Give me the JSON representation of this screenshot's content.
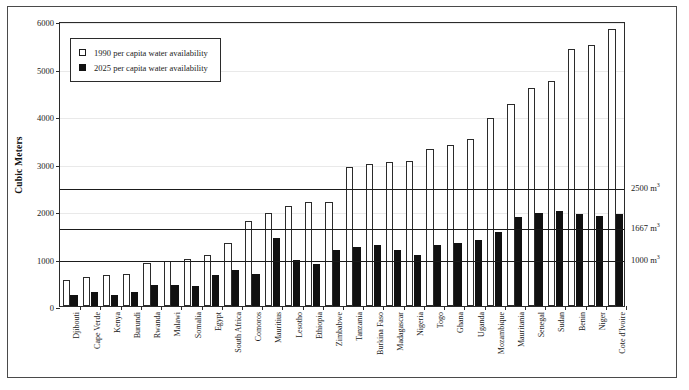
{
  "chart_data": {
    "type": "bar",
    "title": "",
    "xlabel": "",
    "ylabel": "Cubic Meters",
    "ylim": [
      0,
      6000
    ],
    "ytick_values": [
      0,
      1000,
      2000,
      3000,
      4000,
      5000,
      6000
    ],
    "ytick_labels": [
      "0",
      "1000",
      "2000",
      "3000",
      "4000",
      "5000",
      "6000"
    ],
    "grid": true,
    "legend_position": "upper-left-inside",
    "legend": [
      {
        "label": "1990 per capita water availability",
        "swatch": "open-square"
      },
      {
        "label": "2025 per capita water availability",
        "swatch": "filled-square"
      }
    ],
    "categories": [
      "Djibouti",
      "Cape Verde",
      "Kenya",
      "Burundi",
      "Rwanda",
      "Malawi",
      "Somalia",
      "Egypt",
      "South Africa",
      "Comoros",
      "Mauritius",
      "Lesotho",
      "Ethiopia",
      "Zimbabwe",
      "Tanzania",
      "Burkina Faso",
      "Madagascar",
      "Nigeria",
      "Togo",
      "Ghana",
      "Uganda",
      "Mozambique",
      "Mauritania",
      "Senegal",
      "Sudan",
      "Benin",
      "Niger",
      "Cote d'Ivoire"
    ],
    "series": [
      {
        "name": "1990 per capita water availability",
        "color": "#ffffff",
        "values": [
          550,
          620,
          650,
          680,
          900,
          950,
          980,
          1070,
          1320,
          1800,
          1960,
          2100,
          2180,
          2200,
          2920,
          3000,
          3040,
          3050,
          3300,
          3380,
          3510,
          3950,
          4260,
          4590,
          4740,
          5410,
          5490,
          5830
        ]
      },
      {
        "name": "2025 per capita water availability",
        "color": "#111111",
        "values": [
          240,
          290,
          240,
          290,
          440,
          450,
          420,
          650,
          760,
          670,
          1440,
          970,
          880,
          1180,
          1240,
          1290,
          1180,
          1070,
          1290,
          1330,
          1380,
          1550,
          1880,
          1950,
          1990,
          1940,
          1890,
          1930
        ]
      }
    ],
    "threshold_lines": [
      {
        "value": 2500,
        "label": "2500 m",
        "exponent": "3"
      },
      {
        "value": 1667,
        "label": "1667 m",
        "exponent": "3"
      },
      {
        "value": 1000,
        "label": "1000 m",
        "exponent": "3"
      }
    ]
  }
}
